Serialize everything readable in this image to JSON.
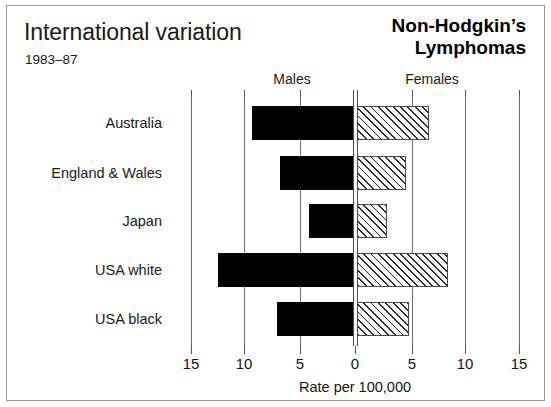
{
  "header": {
    "title": "International variation",
    "period": "1983–87",
    "disease_line1": "Non-Hodgkin’s",
    "disease_line2": "Lymphomas"
  },
  "chart_data": {
    "type": "bar",
    "orientation": "horizontal",
    "layout": "population-pyramid",
    "title": "International variation",
    "subtitle": "1983–87",
    "annotation": "Non-Hodgkin’s Lymphomas",
    "xlabel": "Rate per 100,000",
    "ylabel": "",
    "categories": [
      "Australia",
      "England & Wales",
      "Japan",
      "USA white",
      "USA black"
    ],
    "series": [
      {
        "name": "Males",
        "side": "left",
        "fill": "solid-black",
        "color": "#000000",
        "values": [
          9.3,
          6.7,
          4.1,
          12.4,
          7.0
        ]
      },
      {
        "name": "Females",
        "side": "right",
        "fill": "diagonal-hatch",
        "color": "#ffffff",
        "values": [
          6.6,
          4.5,
          2.8,
          8.4,
          4.8
        ]
      }
    ],
    "left_axis_ticks": [
      15,
      10,
      5,
      0
    ],
    "right_axis_ticks": [
      0,
      5,
      10,
      15
    ],
    "xlim_left": [
      0,
      15
    ],
    "xlim_right": [
      0,
      15
    ],
    "grid": true,
    "grid_axis": "x",
    "legend": "inline-headers"
  },
  "axis": {
    "tick_labels_left": [
      "15",
      "10",
      "5",
      "0"
    ],
    "tick_labels_right": [
      "5",
      "10",
      "15"
    ],
    "axis_title": "Rate per 100,000",
    "sex_headers": [
      {
        "label": "Males",
        "center_px": 285
      },
      {
        "label": "Females",
        "center_px": 425
      }
    ]
  }
}
